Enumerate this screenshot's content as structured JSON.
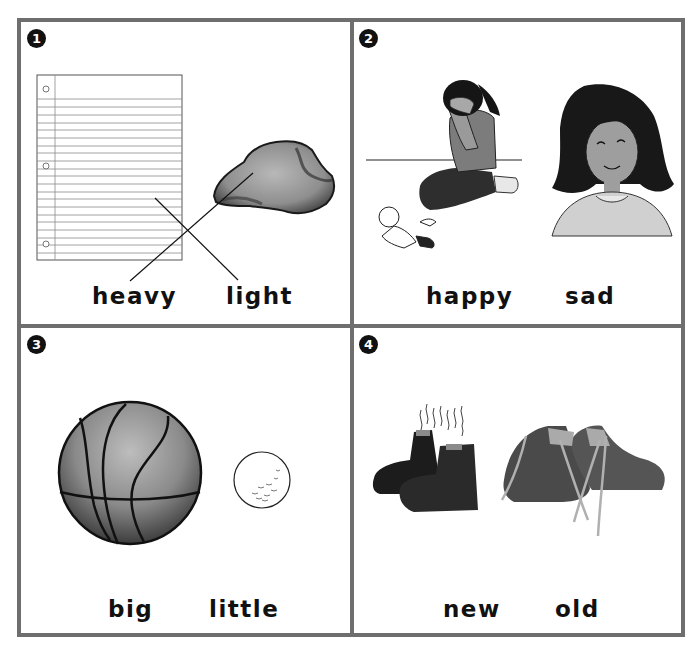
{
  "worksheet": {
    "title": "Opposites picture matching",
    "panels": [
      {
        "number": "1",
        "words": [
          "heavy",
          "light"
        ],
        "pictures": [
          "notebook-paper",
          "crumpled-paper"
        ],
        "drawn_lines": [
          {
            "from": "heavy",
            "to": "crumpled-paper"
          },
          {
            "from": "light",
            "to": "notebook-paper"
          }
        ]
      },
      {
        "number": "2",
        "words": [
          "happy",
          "sad"
        ],
        "pictures": [
          "crying-girl-with-doll",
          "smiling-girl"
        ]
      },
      {
        "number": "3",
        "words": [
          "big",
          "little"
        ],
        "pictures": [
          "basketball",
          "golf-ball"
        ]
      },
      {
        "number": "4",
        "words": [
          "new",
          "old"
        ],
        "pictures": [
          "smelly-old-boots",
          "sneakers"
        ]
      }
    ],
    "colors": {
      "border": "#6e6e6e",
      "badge": "#111111",
      "text": "#111111",
      "background": "#ffffff"
    }
  }
}
